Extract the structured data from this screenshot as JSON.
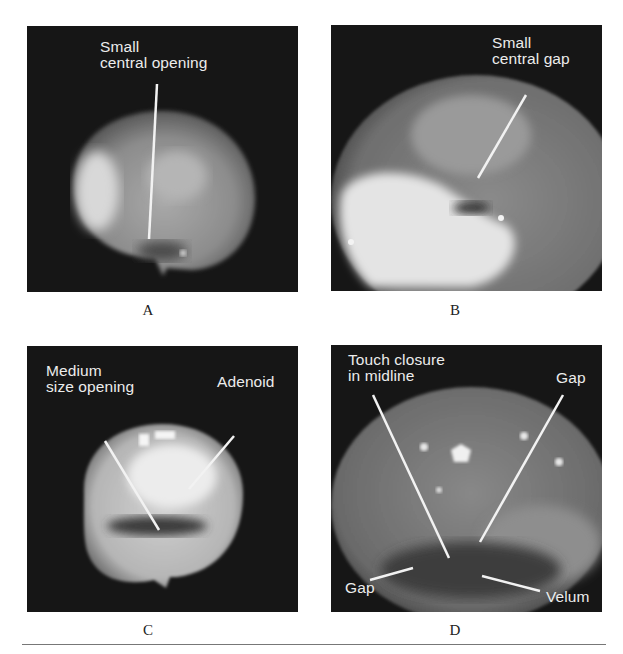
{
  "figure": {
    "panels": [
      {
        "id": "A",
        "caption": "A",
        "labels": [
          "Small\ncentral opening"
        ]
      },
      {
        "id": "B",
        "caption": "B",
        "labels": [
          "Small\ncentral gap"
        ]
      },
      {
        "id": "C",
        "caption": "C",
        "labels": [
          "Medium\nsize opening",
          "Adenoid"
        ]
      },
      {
        "id": "D",
        "caption": "D",
        "labels": [
          "Touch closure\nin midline",
          "Gap",
          "Gap",
          "Velum"
        ]
      }
    ]
  },
  "colors": {
    "panel_bg": "#161616",
    "label": "#ececec",
    "rule": "#777777"
  }
}
